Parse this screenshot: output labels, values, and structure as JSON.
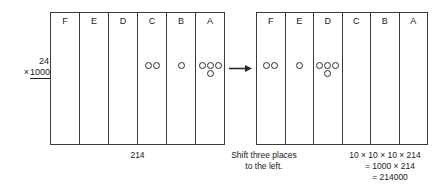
{
  "multiplier": {
    "top": "24",
    "times_symbol": "×",
    "operand": "1000"
  },
  "arrow": {
    "icon": "arrow-right-icon",
    "color": "#2b2b2b"
  },
  "tables": [
    {
      "id": "before",
      "columns": [
        {
          "label": "F",
          "counters": []
        },
        {
          "label": "E",
          "counters": []
        },
        {
          "label": "D",
          "counters": []
        },
        {
          "label": "C",
          "counters": [
            2
          ]
        },
        {
          "label": "B",
          "counters": [
            1
          ]
        },
        {
          "label": "A",
          "counters": [
            3,
            1
          ]
        }
      ]
    },
    {
      "id": "after",
      "columns": [
        {
          "label": "F",
          "counters": [
            2
          ]
        },
        {
          "label": "E",
          "counters": [
            1
          ]
        },
        {
          "label": "D",
          "counters": [
            3,
            1
          ]
        },
        {
          "label": "C",
          "counters": []
        },
        {
          "label": "B",
          "counters": []
        },
        {
          "label": "A",
          "counters": []
        }
      ]
    }
  ],
  "captions": {
    "before_value": "214",
    "shift_line_1": "Shift three places",
    "shift_line_2": "to the left.",
    "result_line_1": "10 × 10 × 10 × 214",
    "result_line_2": "= 1000 × 214",
    "result_line_3": "= 214000"
  }
}
